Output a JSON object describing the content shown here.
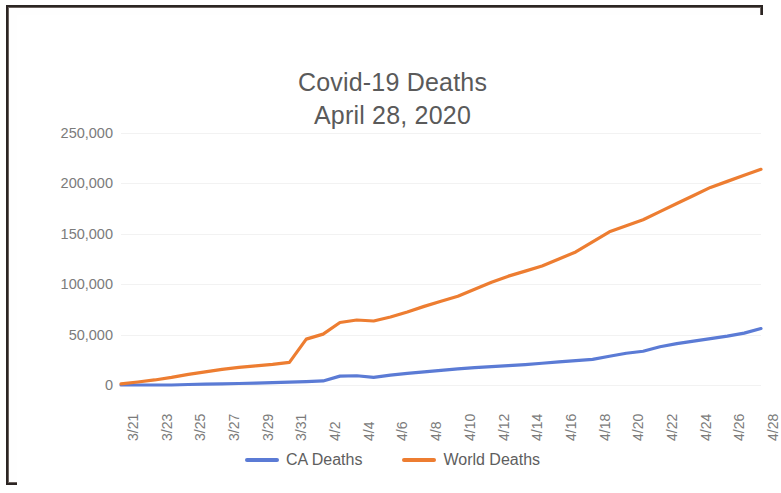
{
  "chart_data": {
    "type": "line",
    "title": "Covid-19 Deaths",
    "subtitle": "April 28, 2020",
    "xlabel": "",
    "ylabel": "",
    "ylim": [
      0,
      250000
    ],
    "ytick_step": 50000,
    "grid": true,
    "legend_position": "bottom",
    "x": [
      "3/21",
      "3/22",
      "3/23",
      "3/24",
      "3/25",
      "3/26",
      "3/27",
      "3/28",
      "3/29",
      "3/30",
      "3/31",
      "4/1",
      "4/2",
      "4/3",
      "4/4",
      "4/5",
      "4/6",
      "4/7",
      "4/8",
      "4/9",
      "4/10",
      "4/11",
      "4/12",
      "4/13",
      "4/14",
      "4/15",
      "4/16",
      "4/17",
      "4/18",
      "4/19",
      "4/20",
      "4/21",
      "4/22",
      "4/23",
      "4/24",
      "4/25",
      "4/26",
      "4/27",
      "4/28"
    ],
    "xtick_labels": [
      "3/21",
      "3/23",
      "3/25",
      "3/27",
      "3/29",
      "3/31",
      "4/2",
      "4/4",
      "4/6",
      "4/8",
      "4/10",
      "4/12",
      "4/14",
      "4/16",
      "4/18",
      "4/20",
      "4/22",
      "4/24",
      "4/26",
      "4/28"
    ],
    "ytick_labels": [
      "250,000",
      "200,000",
      "150,000",
      "100,000",
      "50,000",
      "0"
    ],
    "ytick_values": [
      250000,
      200000,
      150000,
      100000,
      50000,
      0
    ],
    "series": [
      {
        "name": "CA Deaths",
        "color": "#5B7BD5",
        "values": [
          0,
          0,
          0,
          0,
          500,
          800,
          1100,
          1500,
          1900,
          2300,
          2800,
          3400,
          4000,
          8800,
          9200,
          7600,
          9800,
          11500,
          13000,
          14500,
          16000,
          17200,
          18300,
          19200,
          20300,
          21600,
          23000,
          24200,
          25400,
          28500,
          31500,
          33500,
          38000,
          41000,
          43500,
          46000,
          48500,
          51500,
          56000
        ]
      },
      {
        "name": "World Deaths",
        "color": "#ED7D31",
        "values": [
          1200,
          3000,
          5000,
          7500,
          10500,
          13000,
          15500,
          17500,
          19000,
          20500,
          22500,
          45500,
          50500,
          62000,
          64500,
          63500,
          67500,
          72500,
          78000,
          83000,
          88000,
          95000,
          102000,
          108000,
          113000,
          118000,
          125000,
          132000,
          142000,
          152000,
          158000,
          164000,
          172000,
          180000,
          188000,
          196000,
          202000,
          208000,
          214000
        ]
      }
    ]
  },
  "legend": {
    "items": [
      {
        "label": "CA Deaths",
        "color": "#5B7BD5"
      },
      {
        "label": "World Deaths",
        "color": "#ED7D31"
      }
    ]
  }
}
